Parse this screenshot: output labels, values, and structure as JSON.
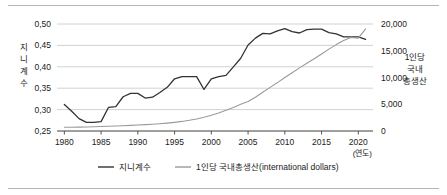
{
  "chart_data": {
    "type": "line",
    "title": "",
    "xlabel": "(연도)",
    "ylabel_left": "지니계수",
    "ylabel_right": "1인당 국내 총생산",
    "grid": true,
    "legend_position": "bottom",
    "x": [
      1980,
      1981,
      1982,
      1983,
      1984,
      1985,
      1986,
      1987,
      1988,
      1989,
      1990,
      1991,
      1992,
      1993,
      1994,
      1995,
      1996,
      1997,
      1998,
      1999,
      2000,
      2001,
      2002,
      2003,
      2004,
      2005,
      2006,
      2007,
      2008,
      2009,
      2010,
      2011,
      2012,
      2013,
      2014,
      2015,
      2016,
      2017,
      2018,
      2019,
      2020,
      2021
    ],
    "xlim": [
      1979,
      2022
    ],
    "xticks": [
      1980,
      1985,
      1990,
      1995,
      2000,
      2005,
      2010,
      2015,
      2020
    ],
    "xtick_labels": [
      "1980",
      "1985",
      "1990",
      "1995",
      "2000",
      "2005",
      "2010",
      "2015",
      "2020"
    ],
    "left_axis": {
      "label": "지니계수",
      "ylim": [
        0.25,
        0.5
      ],
      "ticks": [
        0.25,
        0.3,
        0.35,
        0.4,
        0.45,
        0.5
      ],
      "tick_labels": [
        "0,25",
        "0,30",
        "0,35",
        "0,40",
        "0,45",
        "0,50"
      ]
    },
    "right_axis": {
      "label": "1인당 국내 총생산",
      "label_lines": [
        "1인당",
        "국내",
        "총생산"
      ],
      "ylim": [
        0,
        20000
      ],
      "ticks": [
        0,
        5000,
        10000,
        15000,
        20000
      ],
      "tick_labels": [
        "0",
        "5,000",
        "10,000",
        "15,000",
        "20,000"
      ]
    },
    "series": [
      {
        "name": "지니계수",
        "legend_label": "지니계수",
        "axis": "left",
        "color": "#333333",
        "values": [
          0.312,
          0.296,
          0.279,
          0.27,
          0.27,
          0.272,
          0.305,
          0.307,
          0.33,
          0.338,
          0.338,
          0.327,
          0.329,
          0.34,
          0.352,
          0.372,
          0.377,
          0.377,
          0.377,
          0.347,
          0.372,
          0.377,
          0.38,
          0.4,
          0.42,
          0.451,
          0.467,
          0.478,
          0.477,
          0.484,
          0.489,
          0.482,
          0.479,
          0.487,
          0.488,
          0.488,
          0.48,
          0.477,
          0.47,
          0.47,
          0.47,
          0.464
        ]
      },
      {
        "name": "1인당 국내총생산(international dollars)",
        "legend_label": "1인당 국내총생산(international dollars)",
        "axis": "right",
        "color": "#9a9a9a",
        "values": [
          690,
          700,
          720,
          760,
          800,
          830,
          880,
          930,
          990,
          1050,
          1120,
          1190,
          1270,
          1360,
          1480,
          1620,
          1790,
          2000,
          2250,
          2560,
          2950,
          3380,
          3870,
          4400,
          4980,
          5500,
          6300,
          7250,
          8150,
          9050,
          10000,
          10900,
          11800,
          12650,
          13500,
          14400,
          15300,
          16150,
          16900,
          17500,
          17350,
          19100
        ]
      }
    ]
  },
  "legend": {
    "items": [
      {
        "label": "지니계수",
        "color": "#333333"
      },
      {
        "label": "1인당 국내총생산(international dollars)",
        "color": "#9a9a9a"
      }
    ]
  },
  "axis_note": "(연도)"
}
